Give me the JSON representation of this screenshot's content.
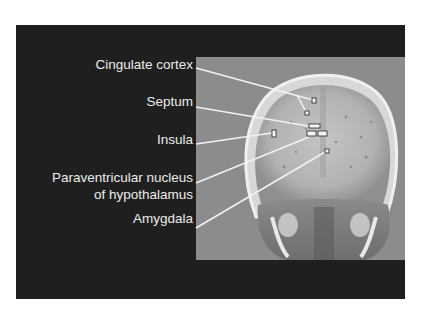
{
  "figure": {
    "background_color": "#1f1f1f",
    "image_background_color": "#8c8c8c",
    "line_color": "#f2f2f2",
    "image_description": "Coronal view of human skull and brain (grayscale scan) with marked regions",
    "labels": [
      {
        "id": "cingulate-cortex",
        "text": "Cingulate cortex"
      },
      {
        "id": "septum",
        "text": "Septum"
      },
      {
        "id": "insula",
        "text": "Insula"
      },
      {
        "id": "paraventricular-line1",
        "text": "Paraventricular nucleus"
      },
      {
        "id": "paraventricular-line2",
        "text": "of hypothalamus"
      },
      {
        "id": "amygdala",
        "text": "Amygdala"
      }
    ]
  }
}
